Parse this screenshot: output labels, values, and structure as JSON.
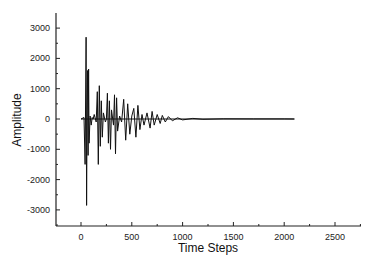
{
  "chart_data": {
    "type": "line",
    "title": "",
    "xlabel": "Time Steps",
    "ylabel": "Amplitude",
    "xlim": [
      -250,
      2750
    ],
    "ylim": [
      -3500,
      3500
    ],
    "xticks": [
      0,
      500,
      1000,
      1500,
      2000,
      2500
    ],
    "xtick_labels": [
      "0",
      "500",
      "1000",
      "1500",
      "2000",
      "2500"
    ],
    "yticks": [
      -3000,
      -2000,
      -1000,
      0,
      1000,
      2000,
      3000
    ],
    "ytick_labels": [
      "-3000",
      "-2000",
      "-1000",
      "0",
      "1000",
      "2000",
      "3000"
    ],
    "grid": false,
    "legend": null,
    "series": [
      {
        "name": "signal",
        "color": "#111111",
        "description": "Decaying burst signal: bursts of oscillation starting near t=0 with peak ~+2700 and trough ~-2850 around t≈50-70, decaying to near zero by t≈1000; flat near 0 until t≈2100.",
        "x": [
          0,
          30,
          40,
          50,
          55,
          60,
          65,
          70,
          75,
          80,
          90,
          100,
          110,
          120,
          130,
          150,
          160,
          170,
          180,
          190,
          200,
          210,
          220,
          240,
          250,
          260,
          270,
          280,
          290,
          300,
          320,
          330,
          340,
          350,
          360,
          380,
          400,
          420,
          440,
          460,
          480,
          500,
          520,
          540,
          560,
          580,
          600,
          620,
          650,
          680,
          700,
          720,
          750,
          780,
          800,
          830,
          860,
          900,
          950,
          1000,
          1100,
          1200,
          1400,
          1700,
          2000,
          2100
        ],
        "values": [
          0,
          50,
          -1500,
          2700,
          -2850,
          300,
          1600,
          -1200,
          1650,
          -800,
          100,
          -200,
          50,
          0,
          150,
          -100,
          900,
          -1500,
          1100,
          -900,
          600,
          -600,
          200,
          -100,
          0,
          850,
          -800,
          600,
          -1000,
          300,
          -200,
          800,
          -1150,
          700,
          -400,
          100,
          -100,
          650,
          -700,
          500,
          -500,
          100,
          350,
          -600,
          450,
          -350,
          150,
          -200,
          200,
          -300,
          250,
          -200,
          150,
          -150,
          120,
          -100,
          80,
          -60,
          40,
          -30,
          20,
          -10,
          5,
          3,
          2,
          0
        ]
      }
    ]
  }
}
